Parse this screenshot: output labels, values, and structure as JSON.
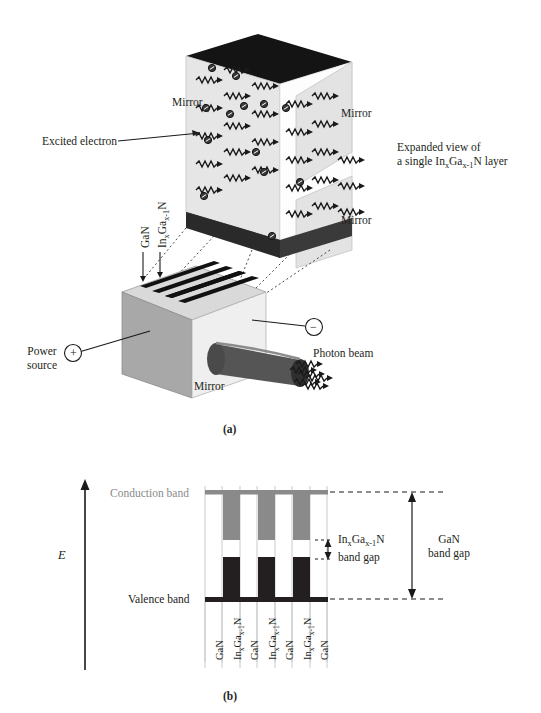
{
  "figure": {
    "panel_a": {
      "caption": "(a)",
      "labels": {
        "mirror_left": "Mirror",
        "mirror_right_top": "Mirror",
        "mirror_right_bottom": "Mirror",
        "mirror_block": "Mirror",
        "excited_electron": "Excited electron",
        "expanded_view_line1": "Expanded view of",
        "expanded_view_line2_pre": "a single In",
        "expanded_view_sub1": "x",
        "expanded_view_mid": "Ga",
        "expanded_view_sub2": "x-1",
        "expanded_view_line2_post": "N  layer",
        "power_source_line1": "Power",
        "power_source_line2": "source",
        "photon_beam": "Photon beam",
        "terminal_positive": "+",
        "terminal_negative": "−",
        "stack_label_gan": "GaN",
        "stack_label_ingan_pre": "In",
        "stack_label_ingan_sub1": "x",
        "stack_label_ingan_mid": "Ga",
        "stack_label_ingan_sub2": "x-1",
        "stack_label_ingan_post": "N"
      }
    },
    "panel_b": {
      "caption": "(b)",
      "axis_label": "E",
      "conduction_band_label": "Conduction band",
      "valence_band_label": "Valence band",
      "ingan_gap_line1_pre": "In",
      "ingan_gap_sub1": "x",
      "ingan_gap_mid": "Ga",
      "ingan_gap_sub2": "x-1",
      "ingan_gap_post": "N",
      "ingan_gap_line2": "band gap",
      "gan_gap_line1": "GaN",
      "gan_gap_line2": "band gap",
      "layer_labels": [
        "GaN",
        "InxGax-1N",
        "GaN",
        "InxGax-1N",
        "GaN",
        "InxGax-1N",
        "GaN"
      ]
    }
  },
  "chart_data": {
    "type": "bar",
    "xlabel": "",
    "ylabel": "E",
    "grid": false,
    "legend": "none",
    "categories": [
      "GaN",
      "InxGax-1N",
      "GaN",
      "InxGax-1N",
      "GaN",
      "InxGax-1N",
      "GaN"
    ],
    "series": [
      {
        "name": "Conduction band edge",
        "color": "#8a8a8a",
        "values": [
          1.0,
          0.62,
          1.0,
          0.62,
          1.0,
          0.62,
          1.0
        ]
      },
      {
        "name": "Valence band edge",
        "color": "#231f20",
        "values": [
          0.0,
          0.38,
          0.0,
          0.38,
          0.0,
          0.38,
          0.0
        ]
      }
    ],
    "annotations": [
      {
        "label": "GaN band gap",
        "from": 0.0,
        "to": 1.0
      },
      {
        "label": "InxGax-1N band gap",
        "from": 0.38,
        "to": 0.62
      }
    ],
    "ylim": [
      0,
      1
    ]
  },
  "colors": {
    "conduction_gray": "#8a8a8a",
    "valence_black": "#231f20",
    "mirror_light": "#e0e0e0",
    "block_mid_gray": "#a6a6a6",
    "block_light": "#ededed",
    "dark_top": "#1a1a1a",
    "beam_gray": "#555555",
    "divider_gray": "#bbbbbb"
  }
}
